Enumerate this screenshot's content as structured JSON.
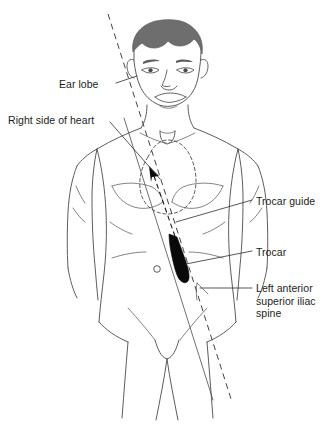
{
  "figure": {
    "background_color": "#ffffff",
    "line_color": "#4a4a4a",
    "hair_color": "#6e6e6e",
    "trocar_color": "#0a0a0a"
  },
  "labels": {
    "ear_lobe": "Ear lobe",
    "right_side_of_heart": "Right side of heart",
    "trocar_guide": "Trocar guide",
    "trocar": "Trocar",
    "left_anterior_superior_iliac_spine": "Left anterior\nsuperior iliac\nspine"
  },
  "annotations": {
    "ear_lobe_target": "right ear lobe",
    "right_side_of_heart_target": "right cardiac border",
    "trocar_guide_target": "guide line along torso",
    "trocar_target": "black trocar instrument in left upper abdomen",
    "iliac_spine_target": "left anterior superior iliac spine"
  },
  "elements": {
    "hair": "hair-shape",
    "navel": "navel-marker",
    "heart_outline": "dashed-heart-outline",
    "insertion_axis": "dashed-insertion-axis",
    "direction_arrow": "upward-left-arrow"
  }
}
